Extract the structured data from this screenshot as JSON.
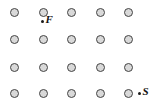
{
  "figure": {
    "background_color": "#ffffff",
    "width": 155,
    "height": 102
  },
  "grid": {
    "rows": 4,
    "columns": 5,
    "node_color": "#d9d9d9",
    "node_outline_color": "#444444",
    "node_diameter": 9,
    "nodes": [
      {
        "row": 0,
        "col": 0,
        "cx": 14,
        "cy": 12
      },
      {
        "row": 0,
        "col": 1,
        "cx": 43,
        "cy": 12
      },
      {
        "row": 0,
        "col": 2,
        "cx": 71,
        "cy": 12
      },
      {
        "row": 0,
        "col": 3,
        "cx": 100,
        "cy": 12
      },
      {
        "row": 0,
        "col": 4,
        "cx": 128,
        "cy": 12
      },
      {
        "row": 1,
        "col": 0,
        "cx": 14,
        "cy": 39
      },
      {
        "row": 1,
        "col": 1,
        "cx": 43,
        "cy": 39
      },
      {
        "row": 1,
        "col": 2,
        "cx": 71,
        "cy": 39
      },
      {
        "row": 1,
        "col": 3,
        "cx": 100,
        "cy": 39
      },
      {
        "row": 1,
        "col": 4,
        "cx": 128,
        "cy": 39
      },
      {
        "row": 2,
        "col": 0,
        "cx": 14,
        "cy": 67
      },
      {
        "row": 2,
        "col": 1,
        "cx": 43,
        "cy": 67
      },
      {
        "row": 2,
        "col": 2,
        "cx": 71,
        "cy": 67
      },
      {
        "row": 2,
        "col": 3,
        "cx": 100,
        "cy": 67
      },
      {
        "row": 2,
        "col": 4,
        "cx": 128,
        "cy": 67
      },
      {
        "row": 3,
        "col": 0,
        "cx": 14,
        "cy": 93
      },
      {
        "row": 3,
        "col": 1,
        "cx": 43,
        "cy": 93
      },
      {
        "row": 3,
        "col": 2,
        "cx": 71,
        "cy": 93
      },
      {
        "row": 3,
        "col": 3,
        "cx": 100,
        "cy": 93
      },
      {
        "row": 3,
        "col": 4,
        "cx": 128,
        "cy": 93
      }
    ]
  },
  "points": [
    {
      "id": "finish",
      "label": "F",
      "x": 43,
      "y": 21,
      "dot_color": "#1a1a1a"
    },
    {
      "id": "start",
      "label": "S",
      "x": 140,
      "y": 93,
      "dot_color": "#1a1a1a"
    }
  ]
}
